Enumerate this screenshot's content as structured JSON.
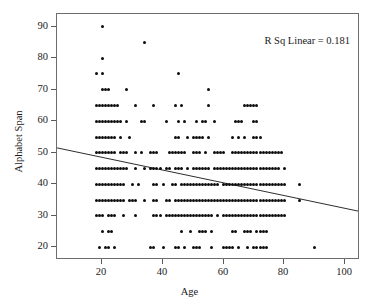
{
  "chart_data": {
    "type": "scatter",
    "title": "",
    "xlabel": "Age",
    "ylabel": "Alphabet Span",
    "xlim": [
      5,
      105
    ],
    "ylim": [
      16,
      94
    ],
    "grid": false,
    "legend": null,
    "xticks": [
      20,
      40,
      60,
      80,
      100
    ],
    "yticks": [
      20,
      30,
      40,
      50,
      60,
      70,
      80,
      90
    ],
    "annotations": [
      {
        "text": "R Sq Linear = 0.181",
        "position": "top-right"
      }
    ],
    "fit_line": {
      "type": "linear",
      "r_squared": 0.181,
      "x_start": 5,
      "y_start": 51.2,
      "x_end": 105,
      "y_end": 31.0
    },
    "marker": {
      "shape": "circle",
      "color": "#0d0d0d",
      "size": 3
    },
    "points": [
      [
        20,
        90
      ],
      [
        34,
        85
      ],
      [
        20,
        80
      ],
      [
        18,
        75
      ],
      [
        20,
        75
      ],
      [
        45,
        75
      ],
      [
        20,
        70
      ],
      [
        21,
        70
      ],
      [
        22,
        70
      ],
      [
        28,
        70
      ],
      [
        55,
        70
      ],
      [
        18,
        65
      ],
      [
        19,
        65
      ],
      [
        20,
        65
      ],
      [
        21,
        65
      ],
      [
        22,
        65
      ],
      [
        23,
        65
      ],
      [
        24,
        65
      ],
      [
        25,
        65
      ],
      [
        31,
        65
      ],
      [
        37,
        65
      ],
      [
        44,
        65
      ],
      [
        46,
        65
      ],
      [
        55,
        65
      ],
      [
        67,
        65
      ],
      [
        68,
        65
      ],
      [
        69,
        65
      ],
      [
        70,
        65
      ],
      [
        71,
        65
      ],
      [
        18,
        60
      ],
      [
        19,
        60
      ],
      [
        20,
        60
      ],
      [
        21,
        60
      ],
      [
        22,
        60
      ],
      [
        23,
        60
      ],
      [
        24,
        60
      ],
      [
        25,
        60
      ],
      [
        26,
        60
      ],
      [
        28,
        60
      ],
      [
        33,
        60
      ],
      [
        34,
        60
      ],
      [
        41,
        60
      ],
      [
        45,
        60
      ],
      [
        47,
        60
      ],
      [
        51,
        60
      ],
      [
        53,
        60
      ],
      [
        54,
        60
      ],
      [
        57,
        60
      ],
      [
        64,
        60
      ],
      [
        65,
        60
      ],
      [
        66,
        60
      ],
      [
        70,
        60
      ],
      [
        71,
        60
      ],
      [
        18,
        55
      ],
      [
        19,
        55
      ],
      [
        20,
        55
      ],
      [
        21,
        55
      ],
      [
        22,
        55
      ],
      [
        23,
        55
      ],
      [
        24,
        55
      ],
      [
        26,
        55
      ],
      [
        29,
        55
      ],
      [
        44,
        55
      ],
      [
        45,
        55
      ],
      [
        48,
        55
      ],
      [
        50,
        55
      ],
      [
        51,
        55
      ],
      [
        52,
        55
      ],
      [
        53,
        55
      ],
      [
        55,
        55
      ],
      [
        63,
        55
      ],
      [
        65,
        55
      ],
      [
        67,
        55
      ],
      [
        70,
        55
      ],
      [
        71,
        55
      ],
      [
        72,
        55
      ],
      [
        18,
        50
      ],
      [
        19,
        50
      ],
      [
        20,
        50
      ],
      [
        21,
        50
      ],
      [
        22,
        50
      ],
      [
        23,
        50
      ],
      [
        24,
        50
      ],
      [
        26,
        50
      ],
      [
        27,
        50
      ],
      [
        28,
        50
      ],
      [
        31,
        50
      ],
      [
        33,
        50
      ],
      [
        36,
        50
      ],
      [
        37,
        50
      ],
      [
        38,
        50
      ],
      [
        42,
        50
      ],
      [
        43,
        50
      ],
      [
        44,
        50
      ],
      [
        45,
        50
      ],
      [
        46,
        50
      ],
      [
        47,
        50
      ],
      [
        50,
        50
      ],
      [
        51,
        50
      ],
      [
        52,
        50
      ],
      [
        54,
        50
      ],
      [
        57,
        50
      ],
      [
        58,
        50
      ],
      [
        59,
        50
      ],
      [
        60,
        50
      ],
      [
        63,
        50
      ],
      [
        64,
        50
      ],
      [
        65,
        50
      ],
      [
        66,
        50
      ],
      [
        67,
        50
      ],
      [
        68,
        50
      ],
      [
        69,
        50
      ],
      [
        70,
        50
      ],
      [
        71,
        50
      ],
      [
        72,
        50
      ],
      [
        73,
        50
      ],
      [
        74,
        50
      ],
      [
        75,
        50
      ],
      [
        76,
        50
      ],
      [
        77,
        50
      ],
      [
        78,
        50
      ],
      [
        79,
        50
      ],
      [
        18,
        45
      ],
      [
        19,
        45
      ],
      [
        20,
        45
      ],
      [
        21,
        45
      ],
      [
        22,
        45
      ],
      [
        23,
        45
      ],
      [
        24,
        45
      ],
      [
        25,
        45
      ],
      [
        26,
        45
      ],
      [
        27,
        45
      ],
      [
        28,
        45
      ],
      [
        31,
        45
      ],
      [
        34,
        45
      ],
      [
        36,
        45
      ],
      [
        37,
        45
      ],
      [
        38,
        45
      ],
      [
        39,
        45
      ],
      [
        41,
        45
      ],
      [
        42,
        45
      ],
      [
        44,
        45
      ],
      [
        45,
        45
      ],
      [
        46,
        45
      ],
      [
        48,
        45
      ],
      [
        50,
        45
      ],
      [
        51,
        45
      ],
      [
        52,
        45
      ],
      [
        53,
        45
      ],
      [
        54,
        45
      ],
      [
        55,
        45
      ],
      [
        57,
        45
      ],
      [
        58,
        45
      ],
      [
        59,
        45
      ],
      [
        60,
        45
      ],
      [
        61,
        45
      ],
      [
        62,
        45
      ],
      [
        63,
        45
      ],
      [
        64,
        45
      ],
      [
        65,
        45
      ],
      [
        66,
        45
      ],
      [
        67,
        45
      ],
      [
        68,
        45
      ],
      [
        69,
        45
      ],
      [
        70,
        45
      ],
      [
        71,
        45
      ],
      [
        72,
        45
      ],
      [
        73,
        45
      ],
      [
        74,
        45
      ],
      [
        75,
        45
      ],
      [
        76,
        45
      ],
      [
        77,
        45
      ],
      [
        78,
        45
      ],
      [
        80,
        45
      ],
      [
        18,
        40
      ],
      [
        19,
        40
      ],
      [
        20,
        40
      ],
      [
        21,
        40
      ],
      [
        22,
        40
      ],
      [
        23,
        40
      ],
      [
        24,
        40
      ],
      [
        25,
        40
      ],
      [
        26,
        40
      ],
      [
        27,
        40
      ],
      [
        30,
        40
      ],
      [
        32,
        40
      ],
      [
        37,
        40
      ],
      [
        38,
        40
      ],
      [
        40,
        40
      ],
      [
        43,
        40
      ],
      [
        44,
        40
      ],
      [
        46,
        40
      ],
      [
        47,
        40
      ],
      [
        48,
        40
      ],
      [
        49,
        40
      ],
      [
        50,
        40
      ],
      [
        51,
        40
      ],
      [
        52,
        40
      ],
      [
        53,
        40
      ],
      [
        54,
        40
      ],
      [
        55,
        40
      ],
      [
        56,
        40
      ],
      [
        57,
        40
      ],
      [
        58,
        40
      ],
      [
        60,
        40
      ],
      [
        61,
        40
      ],
      [
        62,
        40
      ],
      [
        63,
        40
      ],
      [
        64,
        40
      ],
      [
        65,
        40
      ],
      [
        66,
        40
      ],
      [
        67,
        40
      ],
      [
        68,
        40
      ],
      [
        69,
        40
      ],
      [
        70,
        40
      ],
      [
        71,
        40
      ],
      [
        72,
        40
      ],
      [
        73,
        40
      ],
      [
        74,
        40
      ],
      [
        75,
        40
      ],
      [
        76,
        40
      ],
      [
        77,
        40
      ],
      [
        78,
        40
      ],
      [
        79,
        40
      ],
      [
        80,
        40
      ],
      [
        85,
        40
      ],
      [
        18,
        35
      ],
      [
        19,
        35
      ],
      [
        20,
        35
      ],
      [
        21,
        35
      ],
      [
        22,
        35
      ],
      [
        23,
        35
      ],
      [
        24,
        35
      ],
      [
        25,
        35
      ],
      [
        26,
        35
      ],
      [
        27,
        35
      ],
      [
        29,
        35
      ],
      [
        30,
        35
      ],
      [
        31,
        35
      ],
      [
        34,
        35
      ],
      [
        37,
        35
      ],
      [
        38,
        35
      ],
      [
        41,
        35
      ],
      [
        42,
        35
      ],
      [
        44,
        35
      ],
      [
        45,
        35
      ],
      [
        46,
        35
      ],
      [
        47,
        35
      ],
      [
        48,
        35
      ],
      [
        49,
        35
      ],
      [
        50,
        35
      ],
      [
        51,
        35
      ],
      [
        52,
        35
      ],
      [
        53,
        35
      ],
      [
        54,
        35
      ],
      [
        55,
        35
      ],
      [
        56,
        35
      ],
      [
        57,
        35
      ],
      [
        58,
        35
      ],
      [
        59,
        35
      ],
      [
        60,
        35
      ],
      [
        61,
        35
      ],
      [
        62,
        35
      ],
      [
        63,
        35
      ],
      [
        64,
        35
      ],
      [
        65,
        35
      ],
      [
        66,
        35
      ],
      [
        67,
        35
      ],
      [
        68,
        35
      ],
      [
        69,
        35
      ],
      [
        70,
        35
      ],
      [
        71,
        35
      ],
      [
        72,
        35
      ],
      [
        73,
        35
      ],
      [
        74,
        35
      ],
      [
        75,
        35
      ],
      [
        76,
        35
      ],
      [
        77,
        35
      ],
      [
        78,
        35
      ],
      [
        79,
        35
      ],
      [
        80,
        35
      ],
      [
        85,
        35
      ],
      [
        18,
        30
      ],
      [
        19,
        30
      ],
      [
        20,
        30
      ],
      [
        22,
        30
      ],
      [
        23,
        30
      ],
      [
        24,
        30
      ],
      [
        27,
        30
      ],
      [
        31,
        30
      ],
      [
        37,
        30
      ],
      [
        38,
        30
      ],
      [
        39,
        30
      ],
      [
        41,
        30
      ],
      [
        42,
        30
      ],
      [
        43,
        30
      ],
      [
        44,
        30
      ],
      [
        45,
        30
      ],
      [
        46,
        30
      ],
      [
        47,
        30
      ],
      [
        48,
        30
      ],
      [
        49,
        30
      ],
      [
        50,
        30
      ],
      [
        51,
        30
      ],
      [
        52,
        30
      ],
      [
        53,
        30
      ],
      [
        54,
        30
      ],
      [
        55,
        30
      ],
      [
        56,
        30
      ],
      [
        58,
        30
      ],
      [
        60,
        30
      ],
      [
        61,
        30
      ],
      [
        62,
        30
      ],
      [
        63,
        30
      ],
      [
        64,
        30
      ],
      [
        65,
        30
      ],
      [
        66,
        30
      ],
      [
        67,
        30
      ],
      [
        68,
        30
      ],
      [
        69,
        30
      ],
      [
        70,
        30
      ],
      [
        71,
        30
      ],
      [
        72,
        30
      ],
      [
        73,
        30
      ],
      [
        74,
        30
      ],
      [
        75,
        30
      ],
      [
        76,
        30
      ],
      [
        77,
        30
      ],
      [
        78,
        30
      ],
      [
        79,
        30
      ],
      [
        80,
        30
      ],
      [
        20,
        25
      ],
      [
        22,
        25
      ],
      [
        23,
        25
      ],
      [
        46,
        25
      ],
      [
        49,
        25
      ],
      [
        52,
        25
      ],
      [
        53,
        25
      ],
      [
        54,
        25
      ],
      [
        56,
        25
      ],
      [
        63,
        25
      ],
      [
        64,
        25
      ],
      [
        67,
        25
      ],
      [
        68,
        25
      ],
      [
        69,
        25
      ],
      [
        71,
        25
      ],
      [
        72,
        25
      ],
      [
        73,
        25
      ],
      [
        74,
        25
      ],
      [
        19,
        20
      ],
      [
        21,
        20
      ],
      [
        22,
        20
      ],
      [
        24,
        20
      ],
      [
        36,
        20
      ],
      [
        37,
        20
      ],
      [
        40,
        20
      ],
      [
        44,
        20
      ],
      [
        45,
        20
      ],
      [
        47,
        20
      ],
      [
        50,
        20
      ],
      [
        51,
        20
      ],
      [
        52,
        20
      ],
      [
        56,
        20
      ],
      [
        60,
        20
      ],
      [
        61,
        20
      ],
      [
        62,
        20
      ],
      [
        63,
        20
      ],
      [
        65,
        20
      ],
      [
        68,
        20
      ],
      [
        70,
        20
      ],
      [
        71,
        20
      ],
      [
        72,
        20
      ],
      [
        73,
        20
      ],
      [
        74,
        20
      ],
      [
        90,
        20
      ]
    ]
  },
  "axes": {
    "xlabel": "Age",
    "ylabel": "Alphabet Span",
    "xtick_labels": [
      "20",
      "40",
      "60",
      "80",
      "100"
    ],
    "ytick_labels": [
      "20",
      "30",
      "40",
      "50",
      "60",
      "70",
      "80",
      "90"
    ]
  },
  "annotation": {
    "rsq_text": "R Sq Linear = 0.181"
  },
  "style": {
    "background": "#ffffff",
    "frame_color": "#6d6d6d",
    "marker_color": "#0d0d0d",
    "line_color": "#2b2b2b",
    "text_color": "#1a1a1a"
  }
}
